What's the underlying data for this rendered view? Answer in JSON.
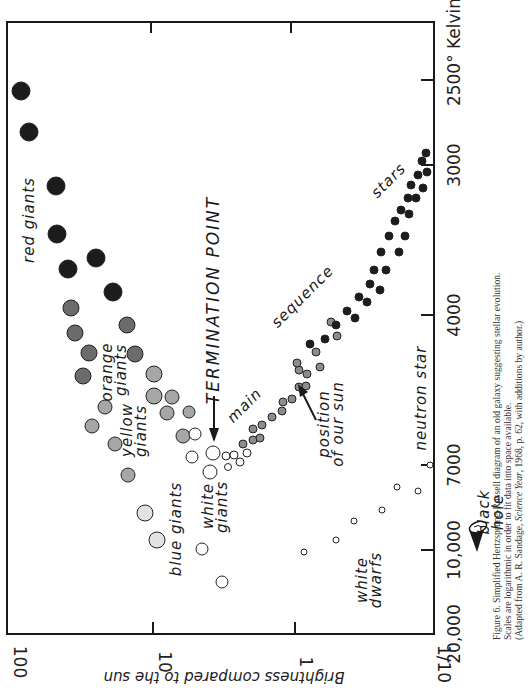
{
  "figure": {
    "caption_line1": "Figure 6. Simplified Hertzsprung-Russell diagram of an old galaxy suggesting stellar evolution.",
    "caption_line2": "Scales are logarithmic in order to fit data into space available.",
    "caption_line3_pre": "(Adapted from A. R. Sandage, ",
    "caption_line3_italic": "Science Year",
    "caption_line3_post": ", 1968, p. 62, with additions by author.)"
  },
  "labels": {
    "red_giants": "red giants",
    "orange": "orange",
    "orange_giants": "giants",
    "yellow": "yellow",
    "yellow_giants": "giants",
    "blue_giants": "blue giants",
    "white": "white",
    "white_giants": "giants",
    "termination_point": "TERMINATION  POINT",
    "main": "main",
    "sequence": "sequence",
    "stars": "stars",
    "position": "position",
    "of_our_sun": "of our sun",
    "white_dwarfs_1": "white",
    "white_dwarfs_2": "dwarfs",
    "neutron_star": "neutron star",
    "black": "black",
    "hole": "hole"
  },
  "chart_data": {
    "type": "scatter",
    "title": "Simplified Hertzsprung-Russell diagram of an old galaxy",
    "xlabel": "Brightness compared to the sun",
    "ylabel": "Temperature (° Kelvin)",
    "x_scale": "log",
    "y_scale": "log",
    "orientation": "rotated 90° (brightness axis along bottom, temperature labels on right)",
    "x_ticks": [
      "100",
      "10",
      "1",
      "1/10"
    ],
    "y_ticks": [
      "20,000",
      "10,000",
      "7000",
      "4000",
      "3000",
      "2500° Kelvin"
    ],
    "xlim": [
      100,
      0.1
    ],
    "ylim": [
      20000,
      2400
    ],
    "grid": false,
    "legend": "none (regions labeled inline)",
    "annotations": [
      "TERMINATION POINT (arrow)",
      "position of our sun (arrow)",
      "black hole (icon)"
    ],
    "series": [
      {
        "name": "red giants",
        "color": "#1c1c1c",
        "points": [
          {
            "px": 21,
            "py": 91,
            "r": 9
          },
          {
            "px": 29,
            "py": 132,
            "r": 9
          },
          {
            "px": 56,
            "py": 186,
            "r": 9
          },
          {
            "px": 57,
            "py": 234,
            "r": 9
          },
          {
            "px": 68,
            "py": 269,
            "r": 9
          },
          {
            "px": 96,
            "py": 258,
            "r": 9
          },
          {
            "px": 113,
            "py": 292,
            "r": 9
          }
        ]
      },
      {
        "name": "orange giants",
        "color": "#6b6b6b",
        "points": [
          {
            "px": 71,
            "py": 308,
            "r": 8
          },
          {
            "px": 75,
            "py": 333,
            "r": 8
          },
          {
            "px": 89,
            "py": 353,
            "r": 8
          },
          {
            "px": 83,
            "py": 376,
            "r": 8
          },
          {
            "px": 127,
            "py": 325,
            "r": 8
          },
          {
            "px": 135,
            "py": 354,
            "r": 8
          }
        ]
      },
      {
        "name": "yellow giants",
        "color": "#a6a6a6",
        "points": [
          {
            "px": 154,
            "py": 374,
            "r": 8
          },
          {
            "px": 154,
            "py": 396,
            "r": 8
          },
          {
            "px": 172,
            "py": 397,
            "r": 7
          },
          {
            "px": 167,
            "py": 413,
            "r": 7
          },
          {
            "px": 189,
            "py": 412,
            "r": 6
          },
          {
            "px": 183,
            "py": 436,
            "r": 7
          },
          {
            "px": 105,
            "py": 407,
            "r": 7
          },
          {
            "px": 115,
            "py": 444,
            "r": 7
          },
          {
            "px": 128,
            "py": 475,
            "r": 7
          },
          {
            "px": 92,
            "py": 426,
            "r": 7
          }
        ]
      },
      {
        "name": "blue giants",
        "color": "#e2e2e2",
        "points": [
          {
            "px": 145,
            "py": 513,
            "r": 8
          },
          {
            "px": 157,
            "py": 540,
            "r": 8
          }
        ]
      },
      {
        "name": "white giants",
        "color": "#ffffff",
        "points": [
          {
            "px": 195,
            "py": 434,
            "r": 6
          },
          {
            "px": 192,
            "py": 457,
            "r": 6
          },
          {
            "px": 213,
            "py": 453,
            "r": 7
          },
          {
            "px": 210,
            "py": 472,
            "r": 7
          },
          {
            "px": 202,
            "py": 549,
            "r": 6
          },
          {
            "px": 222,
            "py": 582,
            "r": 6
          }
        ]
      },
      {
        "name": "main sequence (hot, small)",
        "color": "#ffffff",
        "points": [
          {
            "px": 226,
            "py": 456,
            "r": 4
          },
          {
            "px": 234,
            "py": 455,
            "r": 4
          },
          {
            "px": 228,
            "py": 467,
            "r": 3.5
          },
          {
            "px": 240,
            "py": 462,
            "r": 4
          },
          {
            "px": 247,
            "py": 453,
            "r": 4
          }
        ]
      },
      {
        "name": "main sequence (sun-like)",
        "color": "#8c8c8c",
        "points": [
          {
            "px": 243,
            "py": 444,
            "r": 4
          },
          {
            "px": 253,
            "py": 440,
            "r": 4
          },
          {
            "px": 260,
            "py": 438,
            "r": 4
          },
          {
            "px": 253,
            "py": 429,
            "r": 4
          },
          {
            "px": 262,
            "py": 425,
            "r": 4
          },
          {
            "px": 272,
            "py": 417,
            "r": 4
          },
          {
            "px": 282,
            "py": 411,
            "r": 4
          },
          {
            "px": 283,
            "py": 402,
            "r": 4
          },
          {
            "px": 292,
            "py": 399,
            "r": 4
          },
          {
            "px": 299,
            "py": 387,
            "r": 4
          },
          {
            "px": 306,
            "py": 386,
            "r": 4
          },
          {
            "px": 299,
            "py": 370,
            "r": 4
          },
          {
            "px": 307,
            "py": 374,
            "r": 4
          },
          {
            "px": 320,
            "py": 367,
            "r": 4
          },
          {
            "px": 297,
            "py": 363,
            "r": 4
          },
          {
            "px": 316,
            "py": 352,
            "r": 4
          },
          {
            "px": 337,
            "py": 336,
            "r": 4
          },
          {
            "px": 331,
            "py": 322,
            "r": 4
          }
        ]
      },
      {
        "name": "main sequence (cool)",
        "color": "#1c1c1c",
        "points": [
          {
            "px": 325,
            "py": 339,
            "r": 4
          },
          {
            "px": 336,
            "py": 325,
            "r": 4
          },
          {
            "px": 347,
            "py": 311,
            "r": 4
          },
          {
            "px": 359,
            "py": 297,
            "r": 4
          },
          {
            "px": 370,
            "py": 284,
            "r": 4
          },
          {
            "px": 374,
            "py": 270,
            "r": 4
          },
          {
            "px": 381,
            "py": 252,
            "r": 4
          },
          {
            "px": 389,
            "py": 236,
            "r": 4
          },
          {
            "px": 395,
            "py": 221,
            "r": 4
          },
          {
            "px": 401,
            "py": 210,
            "r": 4
          },
          {
            "px": 408,
            "py": 198,
            "r": 4
          },
          {
            "px": 411,
            "py": 185,
            "r": 4
          },
          {
            "px": 418,
            "py": 175,
            "r": 4
          },
          {
            "px": 422,
            "py": 161,
            "r": 4
          },
          {
            "px": 427,
            "py": 172,
            "r": 4
          },
          {
            "px": 355,
            "py": 318,
            "r": 4
          },
          {
            "px": 367,
            "py": 302,
            "r": 4
          },
          {
            "px": 380,
            "py": 290,
            "r": 4
          },
          {
            "px": 386,
            "py": 270,
            "r": 4
          },
          {
            "px": 399,
            "py": 252,
            "r": 4
          },
          {
            "px": 405,
            "py": 236,
            "r": 4
          },
          {
            "px": 409,
            "py": 214,
            "r": 4
          },
          {
            "px": 416,
            "py": 198,
            "r": 4
          },
          {
            "px": 423,
            "py": 188,
            "r": 4
          },
          {
            "px": 426,
            "py": 153,
            "r": 4
          },
          {
            "px": 310,
            "py": 344,
            "r": 4
          }
        ]
      },
      {
        "name": "white dwarfs",
        "color": "#ffffff",
        "points": [
          {
            "px": 336,
            "py": 540,
            "r": 3
          },
          {
            "px": 354,
            "py": 521,
            "r": 3
          },
          {
            "px": 382,
            "py": 510,
            "r": 3
          },
          {
            "px": 397,
            "py": 487,
            "r": 3
          },
          {
            "px": 418,
            "py": 491,
            "r": 3
          },
          {
            "px": 430,
            "py": 465,
            "r": 3
          },
          {
            "px": 304,
            "py": 552,
            "r": 3
          }
        ]
      }
    ]
  }
}
